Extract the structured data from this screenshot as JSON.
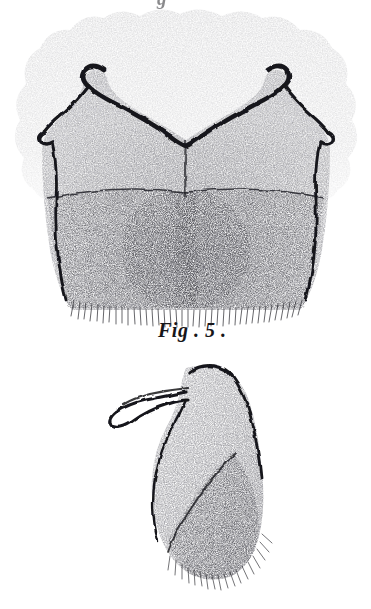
{
  "plate": {
    "background_color": "#ffffff",
    "ink_color": "#1a1a1e",
    "medium": "stipple engraving",
    "width": 371,
    "height": 609
  },
  "top_fragment": {
    "text": "g",
    "note": "cut-off descender of caption above"
  },
  "caption": {
    "text": "Fig . 5 ."
  },
  "figures": [
    {
      "id": "figure-upper",
      "name": "upper-plate-figure",
      "description": "broad bilobed sclerite with paired recurved hooks and dense setal fringe",
      "label": "",
      "parts": [
        {
          "name": "halo",
          "label": "stippled halo"
        },
        {
          "name": "left-hook",
          "label": "left recurved hook"
        },
        {
          "name": "right-hook",
          "label": "right recurved hook"
        },
        {
          "name": "median-notch",
          "label": "median V notch"
        },
        {
          "name": "left-spine",
          "label": "left lateral spine"
        },
        {
          "name": "right-spine",
          "label": "right lateral spine"
        },
        {
          "name": "transverse-suture",
          "label": "transverse suture"
        },
        {
          "name": "setal-fringe",
          "label": "ventral setal fringe"
        }
      ]
    },
    {
      "id": "figure-lower",
      "name": "lower-plate-figure",
      "description": "lateral view of sclerite with apical claw and pilose posterior lobe",
      "label": "",
      "parts": [
        {
          "name": "apical-claw",
          "label": "apical claw"
        },
        {
          "name": "dorsal-ridge",
          "label": "dorsal ridge"
        },
        {
          "name": "oblique-suture",
          "label": "oblique suture"
        },
        {
          "name": "setal-fringe",
          "label": "ventral setal fringe"
        }
      ]
    }
  ]
}
